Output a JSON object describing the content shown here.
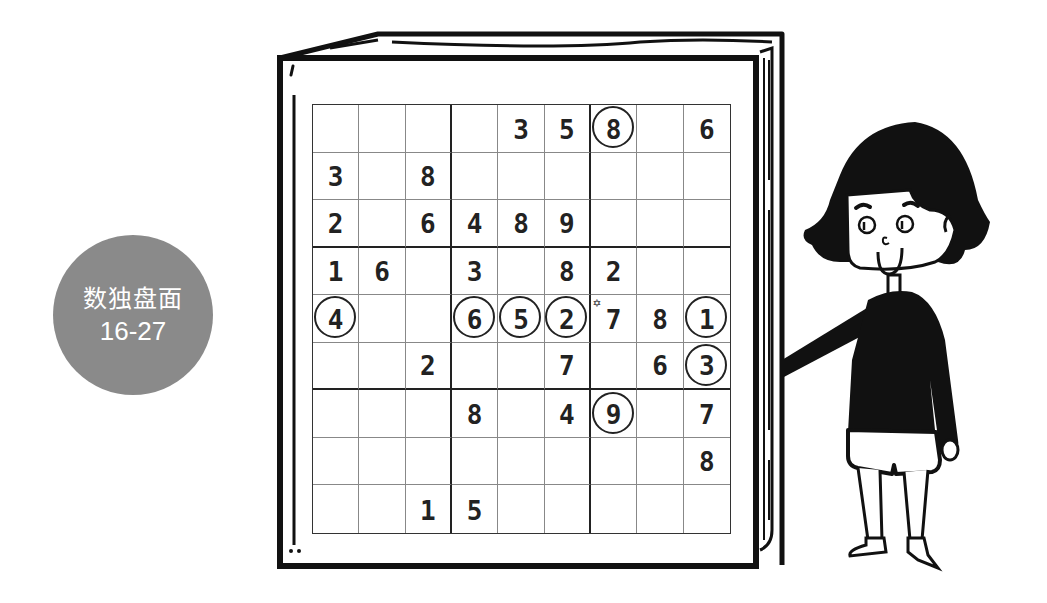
{
  "badge": {
    "title": "数独盘面",
    "subtitle": "16-27",
    "color": "#8a8a8a"
  },
  "puzzle": {
    "rows": [
      [
        "",
        "",
        "",
        "",
        "3",
        "5",
        "8",
        "",
        "6"
      ],
      [
        "3",
        "",
        "8",
        "",
        "",
        "",
        "",
        "",
        ""
      ],
      [
        "2",
        "",
        "6",
        "4",
        "8",
        "9",
        "",
        "",
        ""
      ],
      [
        "1",
        "6",
        "",
        "3",
        "",
        "8",
        "2",
        "",
        ""
      ],
      [
        "4",
        "",
        "",
        "6",
        "5",
        "2",
        "7",
        "8",
        "1"
      ],
      [
        "",
        "",
        "2",
        "",
        "",
        "7",
        "",
        "6",
        "3"
      ],
      [
        "",
        "",
        "",
        "8",
        "",
        "4",
        "9",
        "",
        "7"
      ],
      [
        "",
        "",
        "",
        "",
        "",
        "",
        "",
        "",
        "8"
      ],
      [
        "",
        "",
        "1",
        "5",
        "",
        "",
        "",
        "",
        ""
      ]
    ],
    "circled": [
      [
        0,
        6
      ],
      [
        4,
        0
      ],
      [
        4,
        3
      ],
      [
        4,
        4
      ],
      [
        4,
        5
      ],
      [
        4,
        8
      ],
      [
        5,
        8
      ],
      [
        6,
        6
      ]
    ],
    "starred": [
      [
        4,
        6
      ]
    ],
    "star_glyph": "✡"
  },
  "illustration": {
    "book": "sudoku-book-icon",
    "character": "girl-pointing-icon"
  }
}
